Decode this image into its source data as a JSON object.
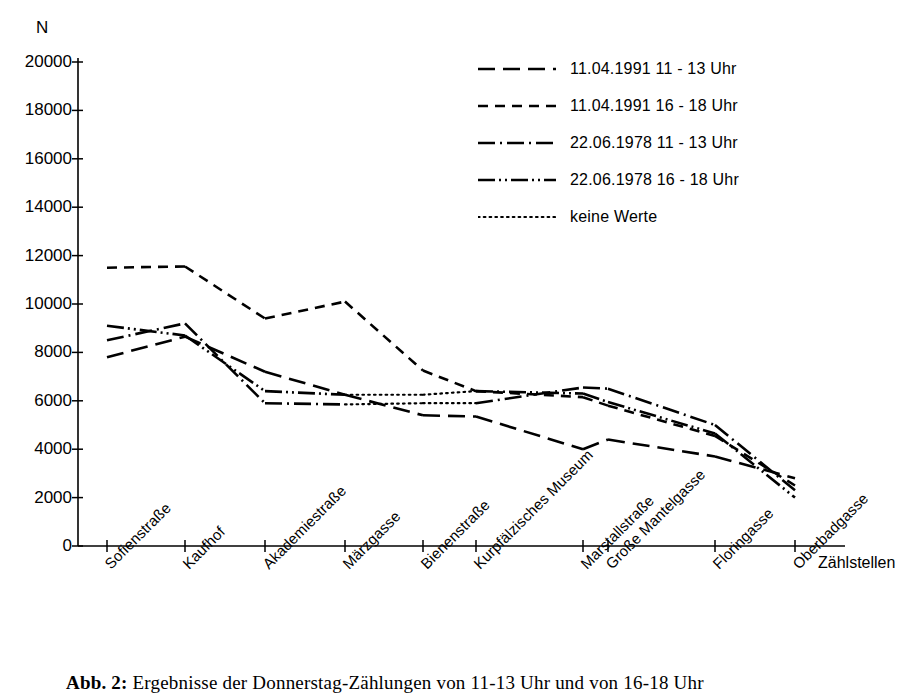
{
  "axes": {
    "y_axis_label": "N",
    "x_axis_label": "Zählstellen",
    "y_ticks": [
      "0",
      "2000",
      "4000",
      "6000",
      "8000",
      "10000",
      "12000",
      "14000",
      "16000",
      "18000",
      "20000"
    ]
  },
  "legend": {
    "items": [
      {
        "label": "11.04.1991  11 - 13 Uhr",
        "style": "long-dash",
        "icon": "long-dash-line-icon"
      },
      {
        "label": "11.04.1991  16 - 18 Uhr",
        "style": "short-dash",
        "icon": "short-dash-line-icon"
      },
      {
        "label": "22.06.1978  11 - 13 Uhr",
        "style": "dash-dot",
        "icon": "dash-dot-line-icon"
      },
      {
        "label": "22.06.1978  16 - 18 Uhr",
        "style": "dash-dot-dot",
        "icon": "dash-dot-dot-line-icon"
      },
      {
        "label": "keine Werte",
        "style": "dotted",
        "icon": "dotted-line-icon"
      }
    ]
  },
  "caption": {
    "number": "Abb. 2:",
    "text": "Ergebnisse der Donnerstag-Zählungen von 11-13 Uhr und von 16-18 Uhr"
  },
  "chart_data": {
    "type": "line",
    "title": "",
    "xlabel": "Zählstellen",
    "ylabel": "N",
    "ylim": [
      0,
      20000
    ],
    "ytick_step": 2000,
    "grid": false,
    "legend_position": "top-right",
    "categories": [
      "Sofienstraße",
      "Kaufhof",
      "Akademiestraße",
      "Märzgasse",
      "Bienenstraße",
      "Kurpfälzisches Museum",
      "Marstallstraße",
      "Große Mantelgasse",
      "Floringasse",
      "Oberbadgasse"
    ],
    "series": [
      {
        "name": "11.04.1991  11 - 13 Uhr",
        "style": "long-dash",
        "values": [
          7800,
          8650,
          7200,
          6250,
          5400,
          5350,
          4000,
          4400,
          3700,
          2800
        ]
      },
      {
        "name": "11.04.1991  16 - 18 Uhr",
        "style": "short-dash",
        "values": [
          11500,
          11550,
          9400,
          10100,
          7250,
          6400,
          6150,
          5800,
          4550,
          2500
        ]
      },
      {
        "name": "22.06.1978  11 - 13 Uhr",
        "style": "dash-dot",
        "values": [
          8500,
          9200,
          5900,
          5850,
          5900,
          5900,
          6550,
          6500,
          5000,
          2300
        ]
      },
      {
        "name": "22.06.1978  16 - 18 Uhr",
        "style": "dash-dot-dot",
        "values": [
          9100,
          8700,
          6400,
          6250,
          6250,
          6400,
          6300,
          5950,
          4650,
          2000
        ]
      }
    ],
    "no_value_segments": [
      {
        "series": "22.06.1978  11 - 13 Uhr",
        "from": "Märzgasse",
        "to": "Kurpfälzisches Museum"
      },
      {
        "series": "22.06.1978  16 - 18 Uhr",
        "from": "Märzgasse",
        "to": "Kurpfälzisches Museum"
      }
    ]
  },
  "colors": {
    "line": "#000000",
    "axis": "#000000",
    "background": "#ffffff"
  }
}
